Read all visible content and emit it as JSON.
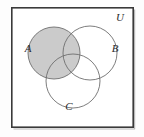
{
  "figure": {
    "type": "venn-diagram",
    "width": 144,
    "height": 137,
    "background_color": "#fdfdfd"
  },
  "universe": {
    "label": "U",
    "label_x": 120,
    "label_y": 21,
    "rect": {
      "x": 11,
      "y": 7,
      "width": 123,
      "height": 121
    },
    "border_color": "#3a3a3a",
    "border_width": 1.6,
    "fill_color": "#ffffff"
  },
  "sets": [
    {
      "id": "A",
      "label": "A",
      "cx": 54,
      "cy": 53,
      "r": 26,
      "fill": "#cbcbcb",
      "stroke": "#6e6e6e",
      "shaded": true,
      "label_x": 28,
      "label_y": 52
    },
    {
      "id": "B",
      "label": "B",
      "cx": 90,
      "cy": 53,
      "r": 27,
      "fill": "none",
      "stroke": "#6e6e6e",
      "shaded": false,
      "label_x": 115,
      "label_y": 52
    },
    {
      "id": "C",
      "label": "C",
      "cx": 73,
      "cy": 81,
      "r": 27,
      "fill": "none",
      "stroke": "#6e6e6e",
      "shaded": false,
      "label_x": 69,
      "label_y": 110
    }
  ],
  "legend": {
    "shaded_region_description": "A"
  }
}
